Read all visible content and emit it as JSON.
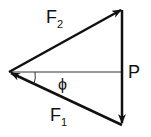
{
  "diagram": {
    "type": "force-vector-triangle",
    "labels": {
      "f2": "F",
      "f2_sub": "2",
      "f1": "F",
      "f1_sub": "1",
      "p": "P",
      "angle": "ϕ"
    },
    "colors": {
      "stroke": "#111111",
      "background": "#ffffff"
    }
  }
}
